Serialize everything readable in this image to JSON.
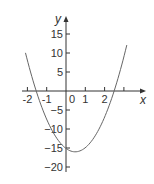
{
  "chart_data": {
    "type": "line",
    "title": "",
    "xlabel": "x",
    "ylabel": "y",
    "function": "y = 4x^2 - 4x - 15",
    "series": [
      {
        "name": "parabola",
        "x": [
          -2.1,
          -2.0,
          -1.5,
          -1.0,
          -0.5,
          0.0,
          0.5,
          1.0,
          1.5,
          2.0,
          2.5,
          3.0,
          3.15
        ],
        "y": [
          10.04,
          9,
          0,
          -7,
          -12,
          -15,
          -16,
          -15,
          -12,
          -7,
          0,
          9,
          12.09
        ]
      }
    ],
    "xlim": [
      -2.4,
      4.2
    ],
    "ylim": [
      -22,
      20
    ],
    "x_ticks": [
      -2,
      -1,
      0,
      1,
      2,
      3
    ],
    "x_tick_labels": [
      "-2",
      "-1",
      "0",
      "1",
      "2"
    ],
    "y_ticks": [
      -20,
      -15,
      -10,
      -5,
      5,
      10,
      15
    ],
    "y_tick_labels": [
      "-20",
      "-15",
      "-10",
      "-5",
      "5",
      "10",
      "15"
    ],
    "grid": false,
    "legend": "none",
    "colors": {
      "curve": "#666666",
      "axis": "#333333"
    }
  }
}
